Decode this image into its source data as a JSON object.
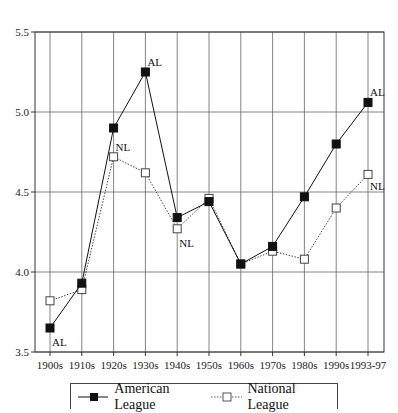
{
  "chart_data": {
    "type": "line",
    "title": "",
    "xlabel": "",
    "ylabel": "",
    "ylim": [
      3.5,
      5.5
    ],
    "yticks": [
      "3.5",
      "4.0",
      "4.5",
      "5.0",
      "5.5"
    ],
    "grid": true,
    "legend_position": "bottom",
    "categories": [
      "1900s",
      "1910s",
      "1920s",
      "1930s",
      "1940s",
      "1950s",
      "1960s",
      "1970s",
      "1980s",
      "1990s",
      "1993-97"
    ],
    "series": [
      {
        "name": "American League",
        "marker": "filled-square",
        "line": "solid",
        "values": [
          3.65,
          3.93,
          4.9,
          5.25,
          4.34,
          4.44,
          4.05,
          4.16,
          4.47,
          4.8,
          5.06
        ]
      },
      {
        "name": "National League",
        "marker": "open-square",
        "line": "dotted",
        "values": [
          3.82,
          3.89,
          4.72,
          4.62,
          4.27,
          4.46,
          4.05,
          4.13,
          4.08,
          4.4,
          4.61
        ]
      }
    ],
    "annotations": [
      {
        "text": "AL",
        "series": "American League",
        "category": "1900s",
        "position": "below"
      },
      {
        "text": "AL",
        "series": "American League",
        "category": "1930s",
        "position": "above-right"
      },
      {
        "text": "AL",
        "series": "American League",
        "category": "1993-97",
        "position": "above-right"
      },
      {
        "text": "NL",
        "series": "National League",
        "category": "1920s",
        "position": "above-right"
      },
      {
        "text": "NL",
        "series": "National League",
        "category": "1940s",
        "position": "below"
      },
      {
        "text": "NL",
        "series": "National League",
        "category": "1993-97",
        "position": "below-right"
      }
    ]
  },
  "legend": {
    "items": [
      {
        "label": "American League"
      },
      {
        "label": "National League"
      }
    ]
  }
}
